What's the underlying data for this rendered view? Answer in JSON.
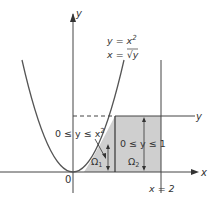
{
  "diagram": {
    "axes": {
      "x_label": "x",
      "y_label": "y",
      "origin_label": "0"
    },
    "curve": {
      "eq1": "y = x",
      "eq1_exp": "2",
      "eq2_lhs": "x = ",
      "eq2_sqrt_arg": "y"
    },
    "line_y1_label": "y",
    "line_x2_label": "x = 2",
    "region1": {
      "name": "Ω",
      "sub": "1",
      "condition": "0 ≤ y ≤ x",
      "condition_exp": "2"
    },
    "region2": {
      "name": "Ω",
      "sub": "2",
      "condition": "0 ≤ y ≤ 1"
    },
    "colors": {
      "shade": "#cfcfcf",
      "line": "#444444"
    }
  }
}
